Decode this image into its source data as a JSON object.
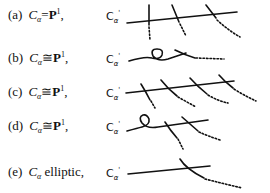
{
  "rows": [
    {
      "tag": "(a)",
      "subject": "C",
      "subscript": "α",
      "relation": "=",
      "space": "P",
      "space_sup": "1",
      "suffix": ",",
      "curve_label": "C",
      "curve_sub": "α",
      "curve_sup": "'"
    },
    {
      "tag": "(b)",
      "subject": "C",
      "subscript": "α",
      "relation": "≅",
      "space": "P",
      "space_sup": "1",
      "suffix": ",",
      "curve_label": "C",
      "curve_sub": "α",
      "curve_sup": "'"
    },
    {
      "tag": "(c)",
      "subject": "C",
      "subscript": "α",
      "relation": "≅",
      "space": "P",
      "space_sup": "1",
      "suffix": ",",
      "curve_label": "C",
      "curve_sub": "α",
      "curve_sup": "'"
    },
    {
      "tag": "(d)",
      "subject": "C",
      "subscript": "α",
      "relation": "≅",
      "space": "P",
      "space_sup": "1",
      "suffix": ",",
      "curve_label": "C",
      "curve_sub": "α",
      "curve_sup": "'"
    },
    {
      "tag": "(e)",
      "subject": "C",
      "subscript": "α",
      "relation": "elliptic",
      "space": "",
      "space_sup": "",
      "suffix": ",",
      "curve_label": "C",
      "curve_sub": "α",
      "curve_sup": "'"
    }
  ]
}
